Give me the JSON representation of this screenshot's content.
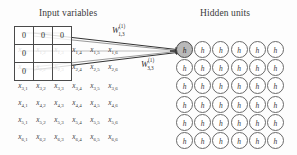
{
  "headings": {
    "input": "Input variables",
    "hidden": "Hidden units"
  },
  "input_table": {
    "rows": [
      [
        "0",
        "0",
        "0"
      ],
      [
        "0",
        "",
        ""
      ],
      [
        "0",
        "",
        ""
      ]
    ]
  },
  "input_variables": {
    "row1": [
      {
        "base": "x",
        "sub": "1,1"
      },
      {
        "base": "x",
        "sub": "1,2"
      },
      {
        "base": "x",
        "sub": "1,3"
      },
      {
        "base": "x",
        "sub": "1,4"
      },
      {
        "base": "x",
        "sub": "1,5"
      },
      {
        "base": "x",
        "sub": "1,6"
      }
    ],
    "row2": [
      {
        "base": "x",
        "sub": "2,1"
      },
      {
        "base": "x",
        "sub": "2,2"
      },
      {
        "base": "x",
        "sub": "2,3"
      },
      {
        "base": "x",
        "sub": "2,4"
      },
      {
        "base": "x",
        "sub": "2,5"
      },
      {
        "base": "x",
        "sub": "2,6"
      }
    ],
    "row3": [
      {
        "base": "x",
        "sub": "3,1"
      },
      {
        "base": "x",
        "sub": "3,2"
      },
      {
        "base": "x",
        "sub": "3,3"
      },
      {
        "base": "x",
        "sub": "3,4"
      },
      {
        "base": "x",
        "sub": "3,5"
      },
      {
        "base": "x",
        "sub": "3,6"
      }
    ],
    "row4": [
      {
        "base": "x",
        "sub": "4,1"
      },
      {
        "base": "x",
        "sub": "4,2"
      },
      {
        "base": "x",
        "sub": "4,3"
      },
      {
        "base": "x",
        "sub": "4,4"
      },
      {
        "base": "x",
        "sub": "4,5"
      },
      {
        "base": "x",
        "sub": "4,6"
      }
    ],
    "row5": [
      {
        "base": "x",
        "sub": "5,1"
      },
      {
        "base": "x",
        "sub": "5,2"
      },
      {
        "base": "x",
        "sub": "5,3"
      },
      {
        "base": "x",
        "sub": "5,4"
      },
      {
        "base": "x",
        "sub": "5,5"
      },
      {
        "base": "x",
        "sub": "5,6"
      }
    ],
    "row6": [
      {
        "base": "x",
        "sub": "6,1"
      },
      {
        "base": "x",
        "sub": "6,2"
      },
      {
        "base": "x",
        "sub": "6,3"
      },
      {
        "base": "x",
        "sub": "6,4"
      },
      {
        "base": "x",
        "sub": "6,5"
      },
      {
        "base": "x",
        "sub": "6,6"
      }
    ]
  },
  "weights": {
    "top": {
      "base": "W",
      "sup": "(1)",
      "sub": "1,3"
    },
    "bottom": {
      "base": "W",
      "sup": "(1)",
      "sub": "3,3"
    }
  },
  "hidden_units": {
    "label": "h",
    "rows": 6,
    "cols": 6,
    "highlighted": {
      "row": 0,
      "col": 0
    }
  },
  "colors": {
    "background": "#fdfdfd",
    "stroke": "#4a4a4a",
    "circle_stroke": "#6a6a6a",
    "highlight_fill": "#b9b9b9",
    "text": "#2b2b2b"
  }
}
